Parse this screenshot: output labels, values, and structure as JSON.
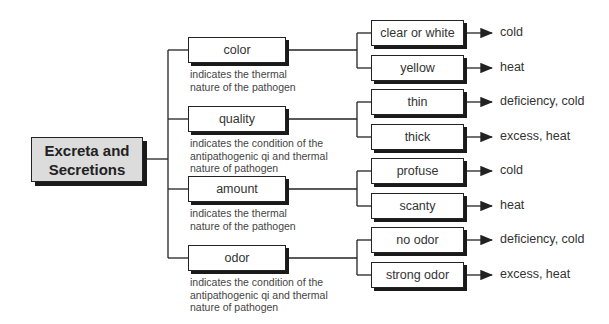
{
  "root": {
    "line1": "Excreta and",
    "line2": "Secretions"
  },
  "categories": [
    {
      "label": "color",
      "desc": [
        "indicates the thermal",
        "nature of the pathogen"
      ],
      "leaves": [
        {
          "label": "clear or white",
          "result": "cold"
        },
        {
          "label": "yellow",
          "result": "heat"
        }
      ]
    },
    {
      "label": "quality",
      "desc": [
        "indicates the condition of the",
        "antipathogenic qi and thermal",
        "nature of pathogen"
      ],
      "leaves": [
        {
          "label": "thin",
          "result": "deficiency, cold"
        },
        {
          "label": "thick",
          "result": "excess, heat"
        }
      ]
    },
    {
      "label": "amount",
      "desc": [
        "indicates the thermal",
        "nature of the pathogen"
      ],
      "leaves": [
        {
          "label": "profuse",
          "result": "cold"
        },
        {
          "label": "scanty",
          "result": "heat"
        }
      ]
    },
    {
      "label": "odor",
      "desc": [
        "indicates the condition of the",
        "antipathogenic qi and thermal",
        "nature of pathogen"
      ],
      "leaves": [
        {
          "label": "no odor",
          "result": "deficiency, cold"
        },
        {
          "label": "strong odor",
          "result": "excess, heat"
        }
      ]
    }
  ]
}
